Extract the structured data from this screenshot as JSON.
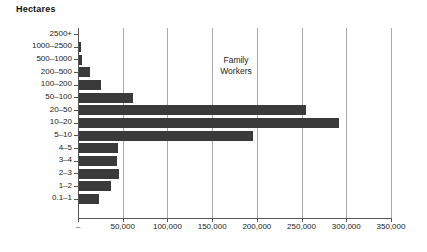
{
  "chart": {
    "title": "Hectares",
    "annotation_line1": "Family",
    "annotation_line2": "Workers",
    "bar_color": "#3a3a3a",
    "grid_color": "#a8a8a8",
    "axis_color": "#555555"
  },
  "chart_data": {
    "type": "bar",
    "orientation": "horizontal",
    "title": "Hectares",
    "xlabel": "",
    "ylabel": "Hectares",
    "xlim": [
      0,
      350000
    ],
    "grid": true,
    "legend": false,
    "annotations": [
      "Family Workers"
    ],
    "categories": [
      "2500+",
      "1000–2500",
      "500–1000",
      "200–500",
      "100–200",
      "50–100",
      "20–50",
      "10–20",
      "5–10",
      "4–5",
      "3–4",
      "2–3",
      "1–2",
      "0.1–1"
    ],
    "series": [
      {
        "name": "Family Workers",
        "values": [
          700,
          3500,
          5000,
          13000,
          26000,
          61000,
          255000,
          292000,
          196000,
          45000,
          44000,
          46000,
          37000,
          23000
        ]
      }
    ],
    "xticks": [
      0,
      50000,
      100000,
      150000,
      200000,
      250000,
      300000,
      350000
    ],
    "xticklabels": [
      "–",
      "50,000",
      "100,000",
      "150,000",
      "200,000",
      "250,000",
      "300,000",
      "350,000"
    ]
  }
}
